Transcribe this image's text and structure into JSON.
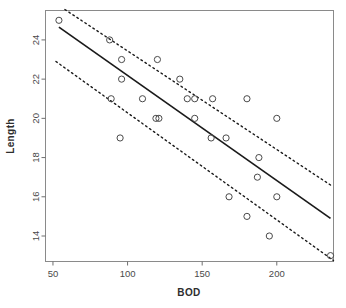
{
  "chart_data": {
    "type": "scatter",
    "title": "",
    "xlabel": "BOD",
    "ylabel": "Length",
    "xlim": [
      45,
      238
    ],
    "ylim": [
      12.7,
      25.5
    ],
    "xticks": [
      50,
      100,
      150,
      200
    ],
    "yticks": [
      14,
      16,
      18,
      20,
      22,
      24
    ],
    "grid": false,
    "legend": null,
    "marker": "open-circle",
    "points": [
      {
        "x": 54,
        "y": 25.0
      },
      {
        "x": 88,
        "y": 24.0
      },
      {
        "x": 96,
        "y": 23.0
      },
      {
        "x": 120,
        "y": 23.0
      },
      {
        "x": 96,
        "y": 22.0
      },
      {
        "x": 135,
        "y": 22.0
      },
      {
        "x": 89,
        "y": 21.0
      },
      {
        "x": 110,
        "y": 21.0
      },
      {
        "x": 140,
        "y": 21.0
      },
      {
        "x": 145,
        "y": 21.0
      },
      {
        "x": 157,
        "y": 21.0
      },
      {
        "x": 180,
        "y": 21.0
      },
      {
        "x": 119,
        "y": 20.0
      },
      {
        "x": 121,
        "y": 20.0
      },
      {
        "x": 145,
        "y": 20.0
      },
      {
        "x": 200,
        "y": 20.0
      },
      {
        "x": 95,
        "y": 19.0
      },
      {
        "x": 156,
        "y": 19.0
      },
      {
        "x": 166,
        "y": 19.0
      },
      {
        "x": 188,
        "y": 18.0
      },
      {
        "x": 187,
        "y": 17.0
      },
      {
        "x": 168,
        "y": 16.0
      },
      {
        "x": 200,
        "y": 16.0
      },
      {
        "x": 180,
        "y": 15.0
      },
      {
        "x": 195,
        "y": 14.0
      },
      {
        "x": 236,
        "y": 13.0
      }
    ],
    "fit_line": {
      "style": "solid",
      "x": [
        54,
        236
      ],
      "y": [
        24.65,
        14.9
      ]
    },
    "confidence_bands": [
      {
        "name": "upper",
        "style": "dotted",
        "x": [
          58,
          236
        ],
        "y": [
          25.55,
          16.6
        ]
      },
      {
        "name": "lower",
        "style": "dotted",
        "x": [
          52,
          238
        ],
        "y": [
          22.9,
          12.75
        ]
      }
    ],
    "colors": {
      "axis": "#6f6f6f",
      "point": "#4a4a4a",
      "fit_line": "#1a1a1a",
      "band": "#1a1a1a",
      "background": "#ffffff"
    }
  },
  "axes": {
    "x_title": "BOD",
    "y_title": "Length",
    "x_tick_labels": [
      "50",
      "100",
      "150",
      "200"
    ],
    "y_tick_labels": [
      "14",
      "16",
      "18",
      "20",
      "22",
      "24"
    ]
  }
}
